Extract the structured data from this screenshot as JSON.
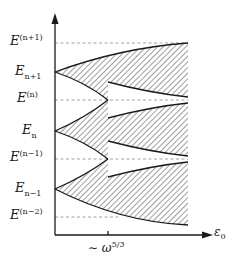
{
  "diagram": {
    "type": "energy-band-diagram",
    "y_axis": {
      "labels": [
        {
          "id": "E_np1_upper",
          "base": "E",
          "sup": "(n+1)",
          "sub": "",
          "y": 43,
          "kind": "dashed-level"
        },
        {
          "id": "E_np1",
          "base": "E",
          "sup": "",
          "sub": "n+1",
          "y": 72,
          "kind": "cusp"
        },
        {
          "id": "E_n_upper",
          "base": "E",
          "sup": "(n)",
          "sub": "",
          "y": 100,
          "kind": "dashed-level"
        },
        {
          "id": "E_n",
          "base": "E",
          "sup": "",
          "sub": "n",
          "y": 131,
          "kind": "cusp"
        },
        {
          "id": "E_nm1_upper",
          "base": "E",
          "sup": "(n−1)",
          "sub": "",
          "y": 159,
          "kind": "dashed-level"
        },
        {
          "id": "E_nm1",
          "base": "E",
          "sup": "",
          "sub": "n−1",
          "y": 189,
          "kind": "cusp"
        },
        {
          "id": "E_nm2_upper",
          "base": "E",
          "sup": "(n−2)",
          "sub": "",
          "y": 217,
          "kind": "dashed-level"
        }
      ]
    },
    "x_axis": {
      "label_base": "ε",
      "label_sub": "0",
      "tick_label_prefix": "∼ ω",
      "tick_label_sup": "5/3",
      "tick_x": 108
    },
    "colors": {
      "line": "#1a1a1a",
      "dashed": "#888888",
      "hatch": "#555555",
      "background": "#ffffff"
    }
  }
}
